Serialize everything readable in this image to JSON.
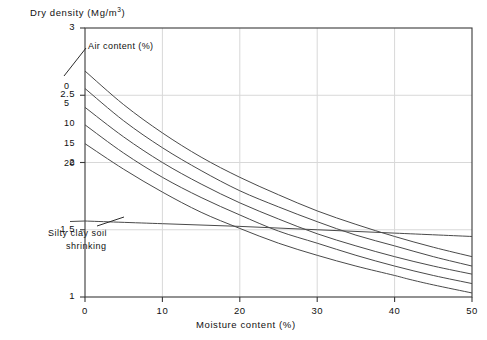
{
  "chart_data": {
    "type": "line",
    "title": "",
    "xlabel": "Moisture content (%)",
    "ylabel": "Dry density (Mg/m3)",
    "ylabel_base": "Dry density (Mg/m",
    "ylabel_exp": "3",
    "ylabel_tail": ")",
    "xlim": [
      0,
      50
    ],
    "ylim": [
      1,
      3
    ],
    "xticks": [
      "0",
      "10",
      "20",
      "30",
      "40",
      "50"
    ],
    "xtick_values": [
      0,
      10,
      20,
      30,
      40,
      50
    ],
    "yticks": [
      "1",
      "1.5",
      "2",
      "2.5",
      "3"
    ],
    "ytick_values": [
      1,
      1.5,
      2,
      2.5,
      3
    ],
    "grid": true,
    "legend_position": "inline-curve-labels",
    "legend_title": "Air content (%)",
    "series": [
      {
        "name": "0",
        "label": "0",
        "air_content_percent": 0,
        "x": [
          0,
          5,
          10,
          15,
          20,
          25,
          30,
          35,
          40,
          45,
          50
        ],
        "values": [
          2.68,
          2.43,
          2.22,
          2.04,
          1.89,
          1.76,
          1.64,
          1.54,
          1.45,
          1.37,
          1.3
        ]
      },
      {
        "name": "5",
        "label": "5",
        "air_content_percent": 5,
        "x": [
          0,
          5,
          10,
          15,
          20,
          25,
          30,
          35,
          40,
          45,
          50
        ],
        "values": [
          2.55,
          2.31,
          2.11,
          1.94,
          1.79,
          1.67,
          1.56,
          1.46,
          1.38,
          1.3,
          1.23
        ]
      },
      {
        "name": "10",
        "label": "10",
        "air_content_percent": 10,
        "x": [
          0,
          5,
          10,
          15,
          20,
          25,
          30,
          35,
          40,
          45,
          50
        ],
        "values": [
          2.41,
          2.19,
          2.0,
          1.84,
          1.7,
          1.58,
          1.47,
          1.38,
          1.3,
          1.23,
          1.17
        ]
      },
      {
        "name": "15",
        "label": "15",
        "air_content_percent": 15,
        "x": [
          0,
          5,
          10,
          15,
          20,
          25,
          30,
          35,
          40,
          45,
          50
        ],
        "values": [
          2.28,
          2.07,
          1.89,
          1.74,
          1.61,
          1.49,
          1.4,
          1.31,
          1.23,
          1.16,
          1.1
        ]
      },
      {
        "name": "20",
        "label": "20",
        "air_content_percent": 20,
        "x": [
          0,
          5,
          10,
          15,
          20,
          25,
          30,
          35,
          40,
          42,
          45,
          50
        ],
        "values": [
          2.14,
          1.95,
          1.78,
          1.63,
          1.51,
          1.4,
          1.31,
          1.23,
          1.16,
          1.13,
          1.09,
          1.03
        ]
      },
      {
        "name": "Silty clay soil shrinking",
        "label": "",
        "x": [
          0,
          10,
          20,
          30,
          40,
          50
        ],
        "values": [
          1.565,
          1.545,
          1.525,
          1.5,
          1.475,
          1.45
        ],
        "annotation_line_1": "Silty clay soil",
        "annotation_line_2": "shrinking"
      }
    ],
    "annotations": [
      {
        "text": "Air content (%)",
        "target_series": "0"
      },
      {
        "text": "Silty clay soil shrinking",
        "target_series": "Silty clay soil shrinking"
      }
    ]
  }
}
